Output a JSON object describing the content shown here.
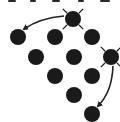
{
  "diagram": {
    "colors": {
      "dot": "#1a1a1a",
      "arrow": "#222222",
      "background": "#ffffff"
    },
    "dot_radius": 8,
    "dots": [
      {
        "id": "burst-top",
        "cx": 73,
        "cy": 19,
        "burst": true
      },
      {
        "id": "r1c1",
        "cx": 18,
        "cy": 37,
        "burst": false
      },
      {
        "id": "r1c2",
        "cx": 55,
        "cy": 37,
        "burst": false
      },
      {
        "id": "r1c3",
        "cx": 92,
        "cy": 37,
        "burst": false
      },
      {
        "id": "r2c1",
        "cx": 36,
        "cy": 57,
        "burst": false
      },
      {
        "id": "r2c2",
        "cx": 74,
        "cy": 57,
        "burst": false
      },
      {
        "id": "burst-right",
        "cx": 111,
        "cy": 57,
        "burst": true
      },
      {
        "id": "r3c1",
        "cx": 55,
        "cy": 76,
        "burst": false
      },
      {
        "id": "r3c2",
        "cx": 92,
        "cy": 76,
        "burst": false
      },
      {
        "id": "r4c1",
        "cx": 74,
        "cy": 95,
        "burst": false
      },
      {
        "id": "bottom",
        "cx": 92,
        "cy": 114,
        "burst": false
      }
    ],
    "arrows": [
      {
        "id": "arrow-top-to-left",
        "from": "burst-top",
        "to": "r1c1",
        "path": "M64,16 Q40,18 24,29"
      },
      {
        "id": "arrow-right-to-bottom",
        "from": "burst-right",
        "to": "bottom",
        "path": "M113,66 Q112,92 98,106"
      }
    ],
    "top_cropped_marks": [
      {
        "x": 8,
        "w": 8
      },
      {
        "x": 30,
        "w": 6
      },
      {
        "x": 52,
        "w": 8
      },
      {
        "x": 78,
        "w": 6
      },
      {
        "x": 100,
        "w": 10
      }
    ]
  }
}
